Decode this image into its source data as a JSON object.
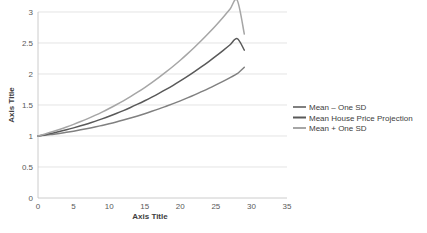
{
  "chart_data": {
    "type": "line",
    "title": "",
    "xlabel": "Axis Title",
    "ylabel": "Axis Title",
    "xlim": [
      0,
      35
    ],
    "ylim": [
      0,
      3
    ],
    "xticks": [
      0,
      5,
      10,
      15,
      20,
      25,
      30,
      35
    ],
    "yticks": [
      0,
      0.5,
      1,
      1.5,
      2,
      2.5,
      3
    ],
    "xtick_labels": [
      "0",
      "5",
      "10",
      "15",
      "20",
      "25",
      "30",
      "35"
    ],
    "ytick_labels": [
      "0",
      "0.5",
      "1",
      "1.5",
      "2",
      "2.5",
      "3"
    ],
    "grid": "horizontal",
    "legend_position": "right",
    "x": [
      0,
      1,
      2,
      3,
      4,
      5,
      6,
      7,
      8,
      9,
      10,
      11,
      12,
      13,
      14,
      15,
      16,
      17,
      18,
      19,
      20,
      21,
      22,
      23,
      24,
      25,
      26,
      27,
      28,
      29
    ],
    "series": [
      {
        "name": "Mean  – One SD",
        "color": "#808080",
        "values": [
          1,
          1.012,
          1.026,
          1.042,
          1.059,
          1.078,
          1.099,
          1.121,
          1.145,
          1.171,
          1.198,
          1.227,
          1.258,
          1.29,
          1.324,
          1.36,
          1.398,
          1.437,
          1.479,
          1.522,
          1.567,
          1.614,
          1.663,
          1.715,
          1.768,
          1.824,
          1.882,
          1.942,
          2.005,
          2.11
        ]
      },
      {
        "name": "Mean House Price Projection",
        "color": "#595959",
        "values": [
          1,
          1.022,
          1.046,
          1.072,
          1.1,
          1.131,
          1.164,
          1.199,
          1.236,
          1.276,
          1.318,
          1.363,
          1.41,
          1.46,
          1.513,
          1.568,
          1.626,
          1.687,
          1.751,
          1.818,
          1.888,
          1.961,
          2.038,
          2.118,
          2.201,
          2.288,
          2.378,
          2.472,
          2.57,
          2.385
        ]
      },
      {
        "name": "Mean + One SD",
        "color": "#a6a6a6",
        "values": [
          1,
          1.033,
          1.068,
          1.105,
          1.145,
          1.188,
          1.233,
          1.281,
          1.332,
          1.386,
          1.443,
          1.504,
          1.568,
          1.636,
          1.707,
          1.782,
          1.861,
          1.945,
          2.033,
          2.125,
          2.222,
          2.324,
          2.431,
          2.543,
          2.661,
          2.784,
          2.913,
          3.048,
          3.19,
          2.645
        ]
      }
    ],
    "legend_items": [
      {
        "label": "Mean  – One SD",
        "color": "#808080"
      },
      {
        "label": "Mean House Price Projection",
        "color": "#595959"
      },
      {
        "label": "Mean + One SD",
        "color": "#a6a6a6"
      }
    ]
  }
}
